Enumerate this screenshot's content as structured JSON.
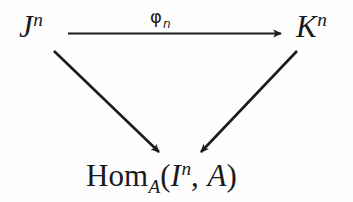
{
  "diagram": {
    "type": "commutative-triangle",
    "background_color": "#fefefe",
    "ink_color": "#1b1b1b",
    "nodes": {
      "source": {
        "base": "J",
        "superscript": "n",
        "full_text": "J^n"
      },
      "target": {
        "base": "K",
        "superscript": "n",
        "full_text": "K^n"
      },
      "bottom": {
        "functor": "Hom",
        "subscript": "A",
        "open_paren": "(",
        "arg_base": "I",
        "arg_superscript": "n",
        "comma": ",",
        "second_arg": "A",
        "close_paren": ")",
        "full_text": "Hom_A(I^n, A)"
      }
    },
    "arrows": [
      {
        "name": "horizontal-arrow",
        "from": "source",
        "to": "target",
        "label": {
          "symbol": "φ",
          "subscript": "n",
          "full_text": "φ_n"
        }
      },
      {
        "name": "left-diagonal-arrow",
        "from": "source",
        "to": "bottom",
        "label": ""
      },
      {
        "name": "right-diagonal-arrow",
        "from": "target",
        "to": "bottom",
        "label": ""
      }
    ]
  }
}
